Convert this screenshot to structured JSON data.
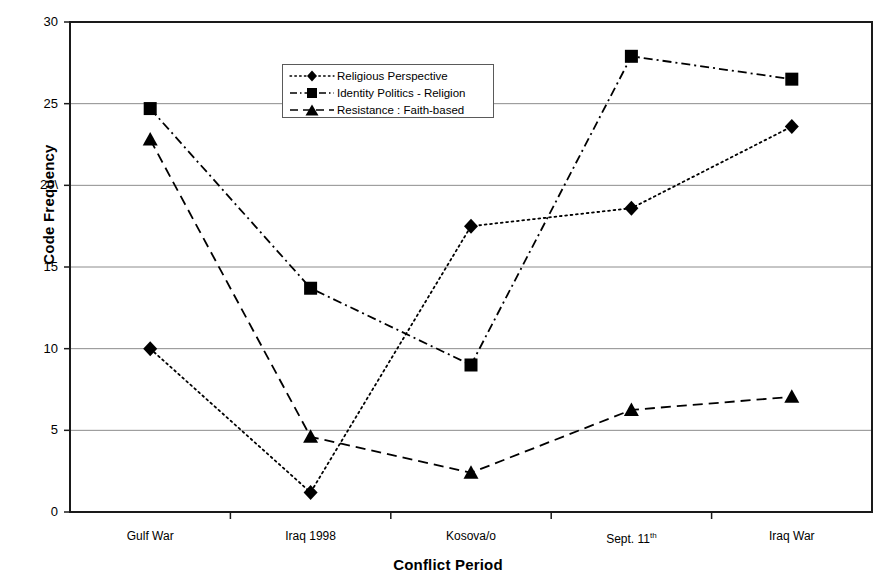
{
  "chart_data": {
    "type": "line",
    "title": "",
    "xlabel": "Conflict Period",
    "ylabel": "Code Frequency",
    "categories": [
      "Gulf War",
      "Iraq 1998",
      "Kosova/o",
      "Sept. 11th",
      "Iraq War"
    ],
    "category_labels_html": [
      "Gulf War",
      "Iraq 1998",
      "Kosova/o",
      "Sept. 11<sup>th</sup>",
      "Iraq War"
    ],
    "ylim": [
      0,
      30
    ],
    "yticks": [
      0,
      5,
      10,
      15,
      20,
      25,
      30
    ],
    "ytick_labels": [
      "0",
      "5",
      "10",
      "15",
      "20\\",
      "25",
      "30"
    ],
    "grid": "horizontal",
    "legend_position": "upper-center-left",
    "series": [
      {
        "name": "Religious Perspective",
        "marker": "diamond",
        "line_style": "dotted",
        "color": "#000000",
        "values": [
          10.0,
          1.2,
          17.5,
          18.6,
          23.6
        ]
      },
      {
        "name": "Identity Politics  - Religion",
        "marker": "square",
        "line_style": "dash-dot",
        "color": "#000000",
        "values": [
          24.7,
          13.7,
          9.0,
          27.9,
          26.5
        ]
      },
      {
        "name": "Resistance : Faith-based",
        "marker": "triangle",
        "line_style": "dashed",
        "color": "#000000",
        "values": [
          22.8,
          4.6,
          2.4,
          6.25,
          7.05
        ]
      }
    ]
  },
  "axes": {
    "y_title": "Code Frequency",
    "x_title": "Conflict Period"
  }
}
